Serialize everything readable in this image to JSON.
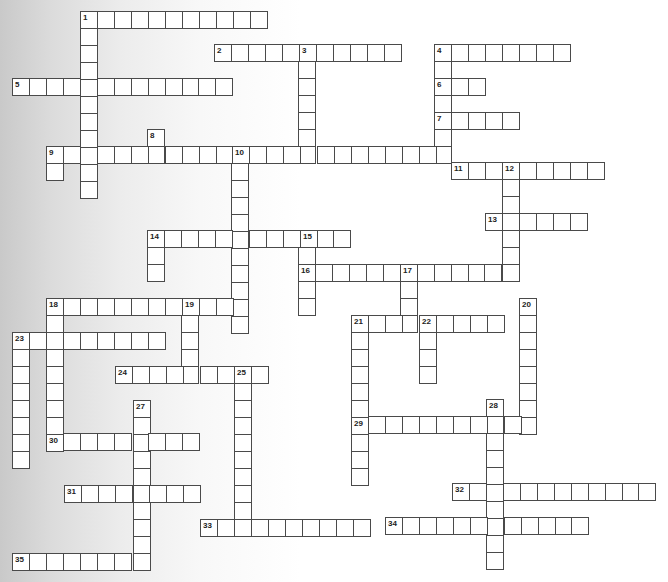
{
  "puzzle": {
    "type": "crossword",
    "cell_size": 16.95,
    "colors": {
      "cell_border": "#4a4a4a",
      "cell_fill": "#ffffff",
      "number": "#222222"
    },
    "words": [
      {
        "num": "1",
        "dir": "across",
        "x": 80,
        "y": 11,
        "len": 11
      },
      {
        "num": "1",
        "dir": "down",
        "x": 80,
        "y": 11,
        "len": 11
      },
      {
        "num": "2",
        "dir": "across",
        "x": 214,
        "y": 44,
        "len": 11
      },
      {
        "num": "3",
        "dir": "down",
        "x": 298,
        "y": 44,
        "len": 7
      },
      {
        "num": "4",
        "dir": "across",
        "x": 434,
        "y": 44,
        "len": 8
      },
      {
        "num": "4",
        "dir": "down",
        "x": 434,
        "y": 44,
        "len": 7
      },
      {
        "num": "5",
        "dir": "across",
        "x": 12,
        "y": 78,
        "len": 13
      },
      {
        "num": "6",
        "dir": "across",
        "x": 434,
        "y": 78,
        "len": 3
      },
      {
        "num": "7",
        "dir": "across",
        "x": 434,
        "y": 112,
        "len": 5
      },
      {
        "num": "8",
        "dir": "down",
        "x": 147,
        "y": 129,
        "len": 2
      },
      {
        "num": "9",
        "dir": "across",
        "x": 46,
        "y": 146,
        "len": 24
      },
      {
        "num": "9",
        "dir": "down",
        "x": 46,
        "y": 146,
        "len": 2
      },
      {
        "num": "10",
        "dir": "down",
        "x": 231,
        "y": 146,
        "len": 11
      },
      {
        "num": "11",
        "dir": "across",
        "x": 451,
        "y": 162,
        "len": 9
      },
      {
        "num": "12",
        "dir": "down",
        "x": 502,
        "y": 162,
        "len": 7
      },
      {
        "num": "13",
        "dir": "across",
        "x": 485,
        "y": 213,
        "len": 6
      },
      {
        "num": "14",
        "dir": "across",
        "x": 147,
        "y": 230,
        "len": 12
      },
      {
        "num": "14",
        "dir": "down",
        "x": 147,
        "y": 230,
        "len": 3
      },
      {
        "num": "15",
        "dir": "down",
        "x": 298,
        "y": 230,
        "len": 5
      },
      {
        "num": "16",
        "dir": "across",
        "x": 298,
        "y": 264,
        "len": 13
      },
      {
        "num": "17",
        "dir": "down",
        "x": 400,
        "y": 264,
        "len": 4
      },
      {
        "num": "18",
        "dir": "across",
        "x": 46,
        "y": 298,
        "len": 12
      },
      {
        "num": "18",
        "dir": "down",
        "x": 46,
        "y": 298,
        "len": 9
      },
      {
        "num": "19",
        "dir": "down",
        "x": 181,
        "y": 298,
        "len": 5
      },
      {
        "num": "20",
        "dir": "down",
        "x": 519,
        "y": 298,
        "len": 8
      },
      {
        "num": "21",
        "dir": "across",
        "x": 351,
        "y": 315,
        "len": 9
      },
      {
        "num": "21",
        "dir": "down",
        "x": 351,
        "y": 315,
        "len": 10
      },
      {
        "num": "22",
        "dir": "down",
        "x": 419,
        "y": 315,
        "len": 4
      },
      {
        "num": "23",
        "dir": "across",
        "x": 12,
        "y": 332,
        "len": 9
      },
      {
        "num": "23",
        "dir": "down",
        "x": 12,
        "y": 332,
        "len": 8
      },
      {
        "num": "24",
        "dir": "across",
        "x": 115,
        "y": 366,
        "len": 9
      },
      {
        "num": "25",
        "dir": "down",
        "x": 234,
        "y": 366,
        "len": 10
      },
      {
        "num": "27",
        "dir": "down",
        "x": 133,
        "y": 400,
        "len": 10
      },
      {
        "num": "28",
        "dir": "down",
        "x": 486,
        "y": 399,
        "len": 10
      },
      {
        "num": "29",
        "dir": "across",
        "x": 351,
        "y": 416,
        "len": 11
      },
      {
        "num": "30",
        "dir": "across",
        "x": 46,
        "y": 433,
        "len": 9
      },
      {
        "num": "31",
        "dir": "across",
        "x": 64,
        "y": 485,
        "len": 8
      },
      {
        "num": "32",
        "dir": "across",
        "x": 452,
        "y": 483,
        "len": 12
      },
      {
        "num": "33",
        "dir": "across",
        "x": 200,
        "y": 519,
        "len": 10
      },
      {
        "num": "34",
        "dir": "across",
        "x": 385,
        "y": 517,
        "len": 12
      },
      {
        "num": "35",
        "dir": "across",
        "x": 12,
        "y": 553,
        "len": 8
      }
    ]
  }
}
